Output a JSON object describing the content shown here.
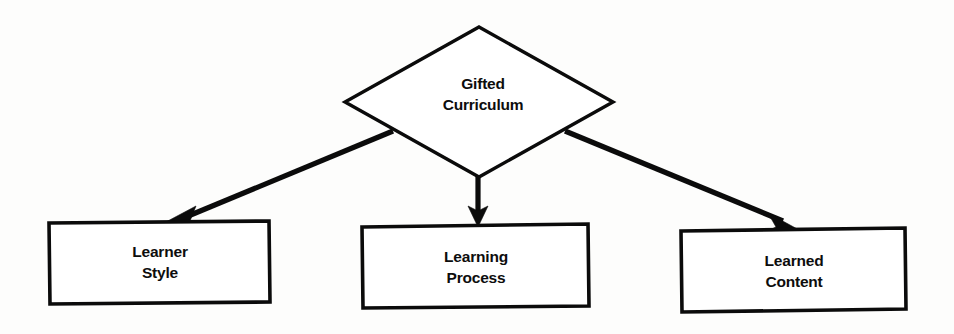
{
  "diagram": {
    "background_color": "#fdfdfc",
    "line_color": "#0b0b0b",
    "shape_fill": "#ffffff",
    "root": {
      "id": "gifted-curriculum",
      "shape": "diamond",
      "label_line1": "Gifted",
      "label_line2": "Curriculum"
    },
    "children": [
      {
        "id": "learner-style",
        "shape": "rectangle",
        "label_line1": "Learner",
        "label_line2": "Style",
        "arrow": "down-left"
      },
      {
        "id": "learning-process",
        "shape": "rectangle",
        "label_line1": "Learning",
        "label_line2": "Process",
        "arrow": "down"
      },
      {
        "id": "learned-content",
        "shape": "rectangle",
        "label_line1": "Learned",
        "label_line2": "Content",
        "arrow": "down-right"
      }
    ]
  }
}
